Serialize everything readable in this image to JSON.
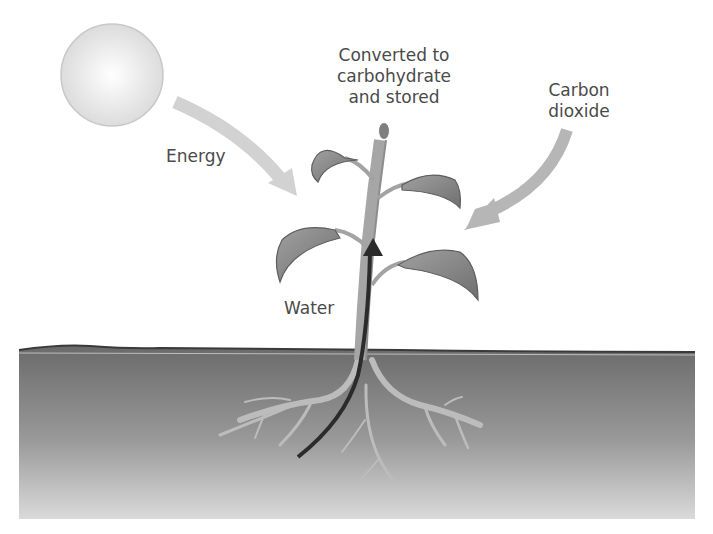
{
  "diagram": {
    "labels": {
      "product": "Converted to\ncarbohydrate\nand stored",
      "energy": "Energy",
      "carbon_dioxide": "Carbon\ndioxide",
      "water": "Water"
    },
    "elements": {
      "sun": "sun",
      "plant": "plant with leaves",
      "soil": "soil",
      "roots": "roots"
    },
    "colors": {
      "sun_fill": "#e6e6e6",
      "arrow_light": "#d0d0d0",
      "arrow_co2": "#b3b3b3",
      "water_arrow": "#2b2b2b",
      "leaf": "#8a8a8a",
      "stem": "#a3a3a3",
      "soil_top": "#6e6e6e",
      "soil_bottom": "#d6d6d6"
    }
  }
}
